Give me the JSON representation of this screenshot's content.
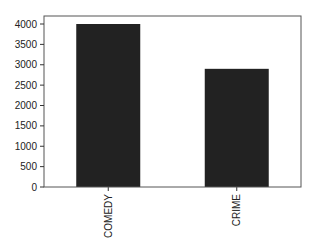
{
  "chart_data": {
    "type": "bar",
    "title": "",
    "xlabel": "",
    "ylabel": "",
    "categories": [
      "COMEDY",
      "CRIME"
    ],
    "values": [
      4000,
      2900
    ],
    "ylim": [
      0,
      4000
    ],
    "yticks": [
      0,
      500,
      1000,
      1500,
      2000,
      2500,
      3000,
      3500,
      4000
    ],
    "ytick_labels": [
      "0",
      "500",
      "1000",
      "1500",
      "2000",
      "2500",
      "3000",
      "3500",
      "4000"
    ],
    "grid": false,
    "legend": null,
    "bar_color": "#222222",
    "xtick_rotation": 90
  }
}
